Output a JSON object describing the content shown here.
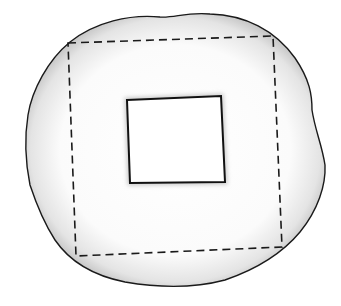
{
  "figure": {
    "colors": {
      "background": "#ffffff",
      "outline": "#1a1a1a",
      "shade": "#bdbdbd",
      "fill": "#ffffff"
    },
    "shapes": {
      "blob": {
        "style": "solid outline, pencil-shaded edge"
      },
      "outer_square": {
        "style": "dashed",
        "corners": [
          [
            68,
            43
          ],
          [
            273,
            36
          ],
          [
            282,
            247
          ],
          [
            76,
            256
          ]
        ]
      },
      "inner_square": {
        "style": "solid",
        "corners": [
          [
            127,
            100
          ],
          [
            221,
            96
          ],
          [
            225,
            182
          ],
          [
            130,
            183
          ]
        ]
      }
    }
  }
}
